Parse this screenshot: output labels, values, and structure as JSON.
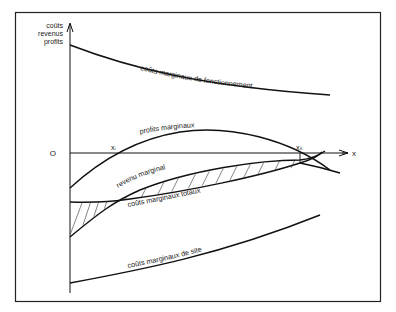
{
  "diagram": {
    "y_axis_label": [
      "coûts",
      "revenus",
      "profits"
    ],
    "x_axis_label": "x",
    "origin_label": "O",
    "points": {
      "x_i": "xᵢ",
      "x_k": "xₖ"
    },
    "curves": [
      {
        "id": "couts-fonctionnement",
        "label": "coûts marginaux de fonctionnement"
      },
      {
        "id": "profits",
        "label": "profits marginaux"
      },
      {
        "id": "revenu",
        "label": "revenu marginal"
      },
      {
        "id": "couts-totaux",
        "label": "coûts marginaux totaux"
      },
      {
        "id": "couts-site",
        "label": "coûts marginaux de site"
      }
    ],
    "colors": {
      "ink": "#111111",
      "background": "#ffffff"
    }
  }
}
